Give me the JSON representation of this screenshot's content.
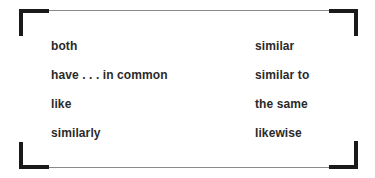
{
  "box": {
    "left_column": [
      "both",
      "have . . . in common",
      "like",
      "similarly"
    ],
    "right_column": [
      "similar",
      "similar to",
      "the same",
      "likewise"
    ]
  },
  "colors": {
    "corner": "#1a1a1a",
    "rule": "#8a8a8a",
    "text": "#2a2a2a"
  }
}
